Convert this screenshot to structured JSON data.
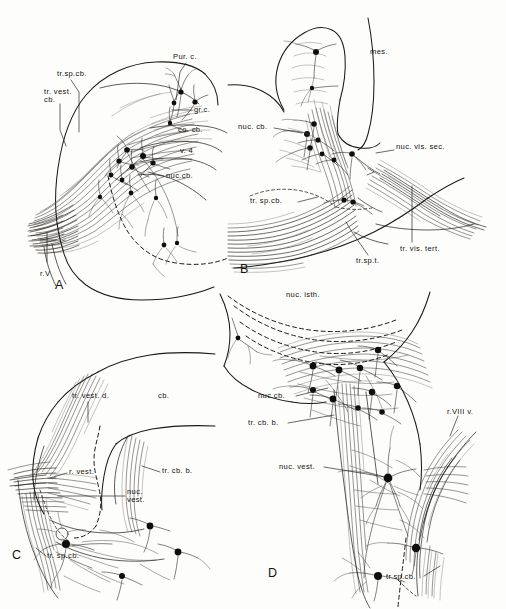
{
  "figure": {
    "kind": "anatomical-plate",
    "panel_count": 4,
    "ink_color": "#1b1916",
    "paper_color": "#fdfdfb"
  },
  "panels": [
    {
      "id": "A",
      "letter": "A",
      "labels": [
        {
          "name": "tr-vest-cb",
          "text": "tr. vest.\ncb.",
          "line1": "tr. vest.",
          "line2": "cb."
        },
        {
          "name": "tr-sp-cb",
          "text": "tr.sp.cb."
        },
        {
          "name": "pur-c",
          "text": "Pur. c."
        },
        {
          "name": "gr-c",
          "text": "gr.c."
        },
        {
          "name": "co-cb",
          "text": "co. cb."
        },
        {
          "name": "v-4",
          "text": "v. 4"
        },
        {
          "name": "nuc-cb",
          "text": "nuc.cb."
        },
        {
          "name": "r-v",
          "text": "r.V"
        }
      ]
    },
    {
      "id": "B",
      "letter": "B",
      "labels": [
        {
          "name": "mes",
          "text": "mes."
        },
        {
          "name": "nuc-cb",
          "text": "nuc. cb."
        },
        {
          "name": "nuc-vis-sec",
          "text": "nuc. vis. sec."
        },
        {
          "name": "tr-sp-cb",
          "text": "tr. sp.cb."
        },
        {
          "name": "tr-sp-t",
          "text": "tr.sp.t."
        },
        {
          "name": "tr-vis-tert",
          "text": "tr. vis. tert."
        }
      ]
    },
    {
      "id": "C",
      "letter": "C",
      "labels": [
        {
          "name": "tr-vest-d",
          "text": "tr. vest. d."
        },
        {
          "name": "cb",
          "text": "cb."
        },
        {
          "name": "r-vest",
          "text": "r. vest."
        },
        {
          "name": "tr-cb-b",
          "text": "tr. cb. b."
        },
        {
          "name": "nuc-vest",
          "text": "nuc.\nvest.",
          "line1": "nuc.",
          "line2": "vest."
        },
        {
          "name": "tr-sp-cb",
          "text": "tr. sp.cb."
        }
      ]
    },
    {
      "id": "D",
      "letter": "D",
      "labels": [
        {
          "name": "nuc-isth",
          "text": "nuc. isth."
        },
        {
          "name": "nuc-cb",
          "text": "nuc.cb."
        },
        {
          "name": "tr-cb-b",
          "text": "tr. cb. b."
        },
        {
          "name": "nuc-vest",
          "text": "nuc. vest."
        },
        {
          "name": "r-viii-v",
          "text": "r.VIII v."
        },
        {
          "name": "tr-sp-cb",
          "text": "tr.sp.cb."
        }
      ]
    }
  ]
}
